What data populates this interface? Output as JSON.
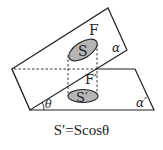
{
  "figure": {
    "type": "projection-area-diagram",
    "labels": {
      "upper_region": "S",
      "lower_region": "S′",
      "upper_figure": "F",
      "lower_figure": "F′",
      "tilted_plane": "α",
      "base_plane": "α′",
      "angle": "θ"
    },
    "formula": "S′=Scosθ",
    "colors": {
      "line": "#222222",
      "region_fill": "#b5b5b5",
      "background": "#ffffff"
    }
  }
}
